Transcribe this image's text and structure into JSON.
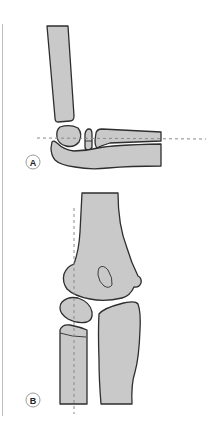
{
  "figure": {
    "panels": [
      {
        "id": "A",
        "label": "A",
        "view": "lateral elbow"
      },
      {
        "id": "B",
        "label": "B",
        "view": "anteroposterior elbow"
      }
    ],
    "colors": {
      "bone_fill": "#c9c9c9",
      "bone_outline": "#2e2e2e",
      "reference_line": "#8a8a8a",
      "label_ring": "#9a9a9a"
    }
  }
}
